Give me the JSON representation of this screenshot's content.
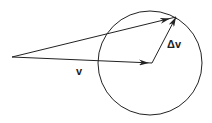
{
  "diagram": {
    "type": "vector-addition",
    "labels": {
      "v": "v",
      "delta_v": "Δv"
    },
    "colors": {
      "stroke": "#222222",
      "background": "#ffffff"
    },
    "circle": {
      "cx": 150,
      "cy": 63,
      "r": 52
    },
    "vectors": [
      {
        "name": "v",
        "from": [
          12,
          57
        ],
        "to": [
          152,
          63
        ]
      },
      {
        "name": "delta_v",
        "from": [
          152,
          63
        ],
        "to": [
          176,
          17
        ]
      },
      {
        "name": "v_plus_delta_v",
        "from": [
          12,
          57
        ],
        "to": [
          176,
          17
        ]
      }
    ]
  }
}
